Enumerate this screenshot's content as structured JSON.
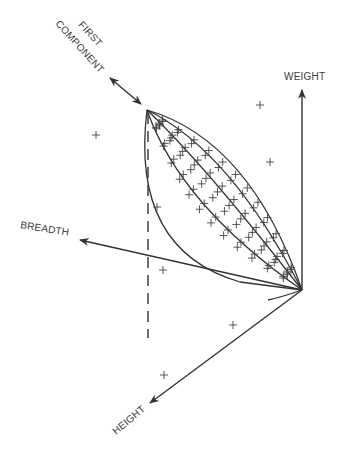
{
  "diagram": {
    "title": "",
    "axes": [
      {
        "id": "weight",
        "label": "WEIGHT"
      },
      {
        "id": "breadth",
        "label": "BREADTH"
      },
      {
        "id": "height",
        "label": "HEIGHT"
      }
    ],
    "component_label_line1": "FIRST",
    "component_label_line2": "COMPONENT",
    "colors": {
      "ink": "#333333",
      "background": "#ffffff"
    },
    "marker": "+"
  }
}
